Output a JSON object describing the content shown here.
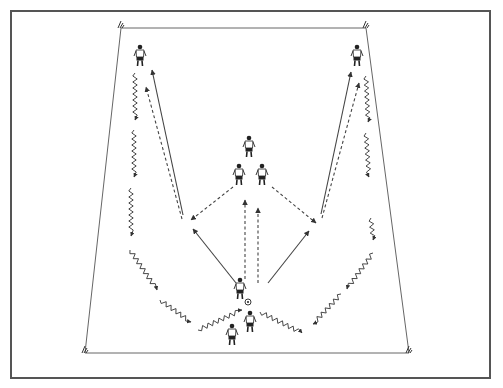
{
  "diagram": {
    "type": "soccer-training-drill",
    "colors": {
      "background": "#ffffff",
      "frame": "#555555",
      "field_lines": "#666666",
      "arrows": "#444444",
      "players": "#222222"
    },
    "frame": {
      "x": 11,
      "y": 11,
      "width": 479,
      "height": 367
    },
    "field": {
      "shape": "trapezoid",
      "corners": {
        "top_left": [
          121,
          28
        ],
        "top_right": [
          366,
          28
        ],
        "bottom_right": [
          409,
          353
        ],
        "bottom_left": [
          85,
          353
        ]
      },
      "corner_flags": 4
    },
    "players": [
      {
        "id": "left-top-wing",
        "x": 140,
        "y": 57
      },
      {
        "id": "right-top-wing",
        "x": 357,
        "y": 57
      },
      {
        "id": "center-top",
        "x": 249,
        "y": 148
      },
      {
        "id": "center-left",
        "x": 239,
        "y": 176
      },
      {
        "id": "center-right",
        "x": 262,
        "y": 176
      },
      {
        "id": "ball-carrier",
        "x": 240,
        "y": 290
      },
      {
        "id": "bottom-left",
        "x": 232,
        "y": 336
      },
      {
        "id": "bottom-right",
        "x": 250,
        "y": 323
      }
    ],
    "ball": {
      "x": 248,
      "y": 302
    },
    "pass_lines_solid": [
      {
        "from": [
          236,
          283
        ],
        "to": [
          193,
          229
        ]
      },
      {
        "from": [
          183,
          215
        ],
        "to": [
          152,
          70
        ]
      },
      {
        "from": [
          268,
          283
        ],
        "to": [
          309,
          231
        ]
      },
      {
        "from": [
          321,
          214
        ],
        "to": [
          351,
          72
        ]
      }
    ],
    "run_lines_dashed": [
      {
        "from": [
          245,
          279
        ],
        "to": [
          245,
          200
        ]
      },
      {
        "from": [
          258,
          283
        ],
        "to": [
          258,
          208
        ]
      },
      {
        "from": [
          233,
          187
        ],
        "to": [
          191,
          220
        ]
      },
      {
        "from": [
          272,
          187
        ],
        "to": [
          316,
          223
        ]
      },
      {
        "from": [
          182,
          219
        ],
        "to": [
          146,
          87
        ]
      },
      {
        "from": [
          322,
          218
        ],
        "to": [
          359,
          83
        ]
      }
    ],
    "dribble_paths_zigzag": [
      {
        "from": [
          135,
          73
        ],
        "to": [
          135,
          120
        ]
      },
      {
        "from": [
          134,
          130
        ],
        "to": [
          134,
          177
        ]
      },
      {
        "from": [
          131,
          188
        ],
        "to": [
          131,
          236
        ]
      },
      {
        "from": [
          130,
          250
        ],
        "to": [
          157,
          290
        ]
      },
      {
        "from": [
          160,
          300
        ],
        "to": [
          191,
          322
        ]
      },
      {
        "from": [
          198,
          330
        ],
        "to": [
          242,
          310
        ]
      },
      {
        "from": [
          260,
          312
        ],
        "to": [
          302,
          333
        ]
      },
      {
        "from": [
          341,
          294
        ],
        "to": [
          313,
          324
        ]
      },
      {
        "from": [
          373,
          253
        ],
        "to": [
          347,
          289
        ]
      },
      {
        "from": [
          371,
          218
        ],
        "to": [
          373,
          240
        ]
      },
      {
        "from": [
          366,
          133
        ],
        "to": [
          369,
          177
        ]
      },
      {
        "from": [
          366,
          76
        ],
        "to": [
          368,
          122
        ]
      }
    ],
    "labels": []
  }
}
